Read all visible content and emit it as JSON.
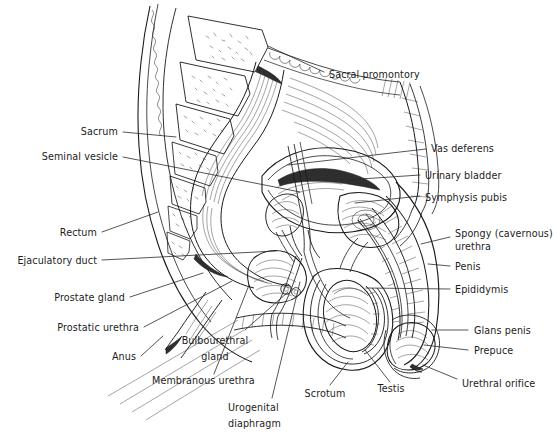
{
  "figure": {
    "background_color": "#ffffff",
    "ink_color": "#1a1a1a",
    "label_color": "#1c1c1c",
    "width": 557,
    "height": 435
  },
  "labels": {
    "sacral_promontory": "Sacral promontory",
    "sacrum": "Sacrum",
    "seminal_vesicle": "Seminal vesicle",
    "rectum": "Rectum",
    "ejaculatory_duct": "Ejaculatory duct",
    "prostate_gland": "Prostate gland",
    "prostatic_urethra": "Prostatic urethra",
    "anus": "Anus",
    "bulbourethral_gland_line1": "Bulbourethral",
    "bulbourethral_gland_line2": "gland",
    "membranous_urethra": "Membranous urethra",
    "urogenital_diaphragm_line1": "Urogenital",
    "urogenital_diaphragm_line2": "diaphragm",
    "scrotum": "Scrotum",
    "testis": "Testis",
    "vas_deferens": "Vas deferens",
    "urinary_bladder": "Urinary bladder",
    "symphysis_pubis": "Symphysis pubis",
    "spongy_urethra_line1": "Spongy (cavernous)",
    "spongy_urethra_line2": "urethra",
    "penis": "Penis",
    "epididymis": "Epididymis",
    "glans_penis": "Glans penis",
    "prepuce": "Prepuce",
    "urethral_orifice": "Urethral orifice"
  },
  "label_positions": {
    "sacral_promontory": {
      "x": 329,
      "y": 75,
      "anchor": "start"
    },
    "sacrum": {
      "x": 118,
      "y": 135,
      "anchor": "end"
    },
    "seminal_vesicle": {
      "x": 118,
      "y": 160,
      "anchor": "end"
    },
    "rectum": {
      "x": 97,
      "y": 236,
      "anchor": "end"
    },
    "ejaculatory_duct": {
      "x": 97,
      "y": 264,
      "anchor": "end"
    },
    "prostate_gland": {
      "x": 125,
      "y": 301,
      "anchor": "end"
    },
    "prostatic_urethra": {
      "x": 139,
      "y": 331,
      "anchor": "end"
    },
    "anus": {
      "x": 136,
      "y": 360,
      "anchor": "end"
    },
    "bulbourethral_gland": {
      "x": 215,
      "y": 344,
      "anchor": "middle"
    },
    "membranous_urethra": {
      "x": 152,
      "y": 382,
      "anchor": "start"
    },
    "urogenital_diaphragm": {
      "x": 228,
      "y": 409,
      "anchor": "start"
    },
    "scrotum": {
      "x": 325,
      "y": 394,
      "anchor": "middle"
    },
    "testis": {
      "x": 391,
      "y": 390,
      "anchor": "middle"
    },
    "vas_deferens": {
      "x": 431,
      "y": 152,
      "anchor": "start"
    },
    "urinary_bladder": {
      "x": 425,
      "y": 178,
      "anchor": "start"
    },
    "symphysis_pubis": {
      "x": 425,
      "y": 200,
      "anchor": "start"
    },
    "spongy_urethra": {
      "x": 455,
      "y": 237,
      "anchor": "start"
    },
    "penis": {
      "x": 455,
      "y": 269,
      "anchor": "start"
    },
    "epididymis": {
      "x": 455,
      "y": 292,
      "anchor": "start"
    },
    "glans_penis": {
      "x": 474,
      "y": 333,
      "anchor": "start"
    },
    "prepuce": {
      "x": 474,
      "y": 353,
      "anchor": "start"
    },
    "urethral_orifice": {
      "x": 462,
      "y": 385,
      "anchor": "start"
    }
  },
  "leader_lines": {
    "sacral_promontory": "M 268,46 L 324,72",
    "sacrum": "M 123,132 L 176,137",
    "seminal_vesicle": "M 123,157 L 300,192",
    "rectum": "M 102,232 L 158,212",
    "ejaculatory_duct": "M 102,260 L 276,251",
    "prostate_gland": "M 130,297 L 203,273",
    "prostatic_urethra": "M 144,327 L 232,281",
    "anus": "M 141,356 L 163,336",
    "bulbourethral_gland": "M 245,330 L 288,292",
    "membranous_urethra": "M 214,374 L 249,285",
    "urogenital_diaphragm": "M 272,398 L 300,282",
    "scrotum": "M 330,385 L 348,362",
    "testis": "M 390,382 L 365,350",
    "vas_deferens": "M 426,149 L 288,165",
    "urinary_bladder": "M 420,175 L 331,181",
    "symphysis_pubis": "M 420,196 L 355,203",
    "spongy_urethra": "M 450,237 L 421,244",
    "penis": "M 450,266 L 428,264",
    "epididymis": "M 450,289 L 366,288",
    "glans_penis": "M 468,330 L 432,330",
    "prepuce": "M 468,350 L 424,345",
    "urethral_orifice": "M 457,379 L 423,365"
  }
}
